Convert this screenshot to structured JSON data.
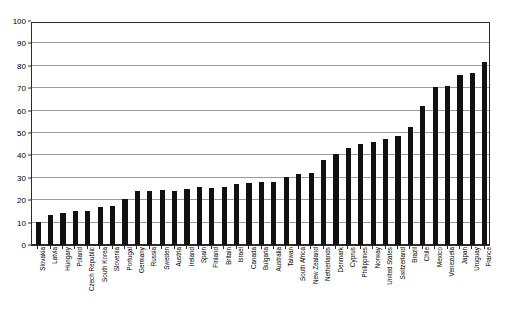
{
  "chart_data": {
    "type": "bar",
    "title": "",
    "subtitle": "",
    "xlabel": "",
    "ylabel": "",
    "ylim": [
      0,
      100
    ],
    "ytick_step": 10,
    "yticks": [
      0,
      10,
      20,
      30,
      40,
      50,
      60,
      70,
      80,
      90,
      100
    ],
    "grid": true,
    "legend": false,
    "legend_position": "none",
    "bar_color": "#111111",
    "grid_color": "#9a9a9a",
    "axis_color": "#2b2b2b",
    "background_color": "#ffffff",
    "label_rotation": 90,
    "sorted": "ascending",
    "categories": [
      "Slovakia",
      "Latvia",
      "Hungary",
      "Poland",
      "Czech Republic",
      "South Korea",
      "Slovenia",
      "Portugal",
      "Germany",
      "Russia",
      "Sweden",
      "Austria",
      "Ireland",
      "Spain",
      "Finland",
      "Britain",
      "Israel",
      "Canada",
      "Bulgaria",
      "Australia",
      "Taiwan",
      "South Africa",
      "New Zealand",
      "Netherlands",
      "Denmark",
      "Cyprus",
      "Philippines",
      "Norway",
      "United States",
      "Switzerland",
      "Brazil",
      "Chile",
      "Mexico",
      "Venezuela",
      "Japan",
      "Uruguay",
      "France"
    ],
    "values": [
      10.3,
      13.6,
      14.3,
      15.0,
      15.2,
      16.8,
      17.2,
      20.5,
      24.2,
      24.1,
      24.4,
      24.3,
      25.0,
      25.8,
      25.6,
      26.0,
      27.4,
      27.6,
      28.0,
      28.2,
      30.2,
      31.8,
      32.0,
      37.9,
      40.8,
      43.3,
      45.2,
      46.0,
      47.5,
      48.7,
      52.6,
      62.0,
      70.5,
      71.0,
      75.8,
      77.0,
      81.6
    ]
  }
}
